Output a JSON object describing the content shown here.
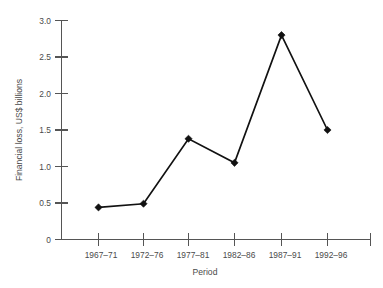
{
  "chart_data": {
    "type": "line",
    "title": "",
    "xlabel": "Period",
    "ylabel": "Financial loss, US$ billions",
    "categories": [
      "1967–71",
      "1972–76",
      "1977–81",
      "1982–86",
      "1987–91",
      "1992–96"
    ],
    "values": [
      0.44,
      0.49,
      1.38,
      1.05,
      2.8,
      1.5
    ],
    "series": [
      {
        "name": "Financial loss",
        "values": [
          0.44,
          0.49,
          1.38,
          1.05,
          2.8,
          1.5
        ]
      }
    ],
    "ylim": [
      0,
      3.0
    ],
    "ytick_labels": [
      "0",
      "0.5",
      "1.0",
      "1.5",
      "2.0",
      "2.5",
      "3.0"
    ],
    "ytick_values": [
      0,
      0.5,
      1.0,
      1.5,
      2.0,
      2.5,
      3.0
    ],
    "xtick_labels": [
      "1967–71",
      "1972–76",
      "1977–81",
      "1982–86",
      "1987–91",
      "1992–96"
    ],
    "grid": false,
    "legend": "none",
    "marker": "diamond",
    "line_color": "#111111",
    "marker_color": "#111111",
    "axis_color": "#555555",
    "text_color": "#4a4a4a",
    "background_color": "#ffffff"
  }
}
